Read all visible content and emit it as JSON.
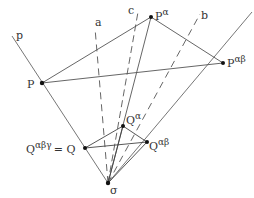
{
  "diagram": {
    "colors": {
      "line": "#555555",
      "point": "#111111",
      "text": "#333333",
      "background": "#ffffff"
    },
    "points": {
      "O": {
        "label": "O",
        "x": 108,
        "y": 183
      },
      "P": {
        "label": "P",
        "x": 42,
        "y": 83
      },
      "Pa": {
        "label": "P",
        "sup": "α",
        "x": 151,
        "y": 17
      },
      "Pab": {
        "label": "P",
        "sup": "αβ",
        "x": 223,
        "y": 63
      },
      "Q": {
        "label": "Q",
        "x": 85,
        "y": 148
      },
      "Qa": {
        "label": "Q",
        "sup": "α",
        "x": 123,
        "y": 126
      },
      "Qab": {
        "label": "Q",
        "sup": "αβ",
        "x": 147,
        "y": 142
      }
    },
    "line_labels": {
      "p": "p",
      "a": "a",
      "b": "b",
      "c": "c"
    },
    "equation_label": {
      "lhs": "Q",
      "lhs_sup": "αβγ",
      "eq": "= Q"
    },
    "origin_label": "σ"
  }
}
